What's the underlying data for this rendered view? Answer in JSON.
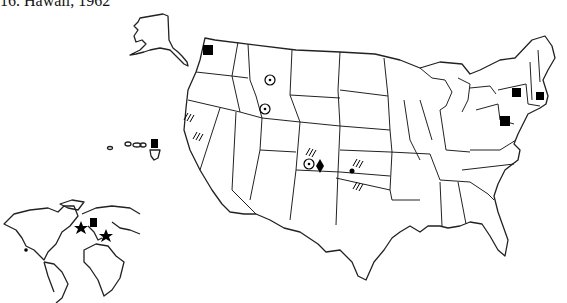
{
  "caption": "16. Hawaii, 1962",
  "map": {
    "title": "United States with Alaska, Hawaii and world inset",
    "colors": {
      "line": "#222222",
      "marker": "#000000",
      "background": "#ffffff"
    },
    "legend_symbols": [
      "black-square",
      "circle-dot",
      "hatch-marks",
      "diamond",
      "dot",
      "star"
    ],
    "markers": [
      {
        "region": "Washington",
        "symbol": "square"
      },
      {
        "region": "Montana",
        "symbol": "circle-dot"
      },
      {
        "region": "Idaho",
        "symbol": "circle-dot"
      },
      {
        "region": "Northern California (north)",
        "symbol": "hatch"
      },
      {
        "region": "Northern California (south)",
        "symbol": "hatch"
      },
      {
        "region": "Colorado",
        "symbol": "hatch"
      },
      {
        "region": "Colorado",
        "symbol": "circle-dot"
      },
      {
        "region": "Colorado",
        "symbol": "diamond"
      },
      {
        "region": "Kansas",
        "symbol": "hatch"
      },
      {
        "region": "Kansas",
        "symbol": "dot"
      },
      {
        "region": "Oklahoma",
        "symbol": "hatch"
      },
      {
        "region": "New York",
        "symbol": "square"
      },
      {
        "region": "Massachusetts",
        "symbol": "square"
      },
      {
        "region": "Pennsylvania",
        "symbol": "square"
      },
      {
        "region": "Hawaii",
        "symbol": "square"
      },
      {
        "region": "British Isles",
        "symbol": "star"
      },
      {
        "region": "Scandinavia",
        "symbol": "square"
      },
      {
        "region": "Eastern Europe",
        "symbol": "star"
      },
      {
        "region": "Mexico",
        "symbol": "dot"
      }
    ]
  }
}
